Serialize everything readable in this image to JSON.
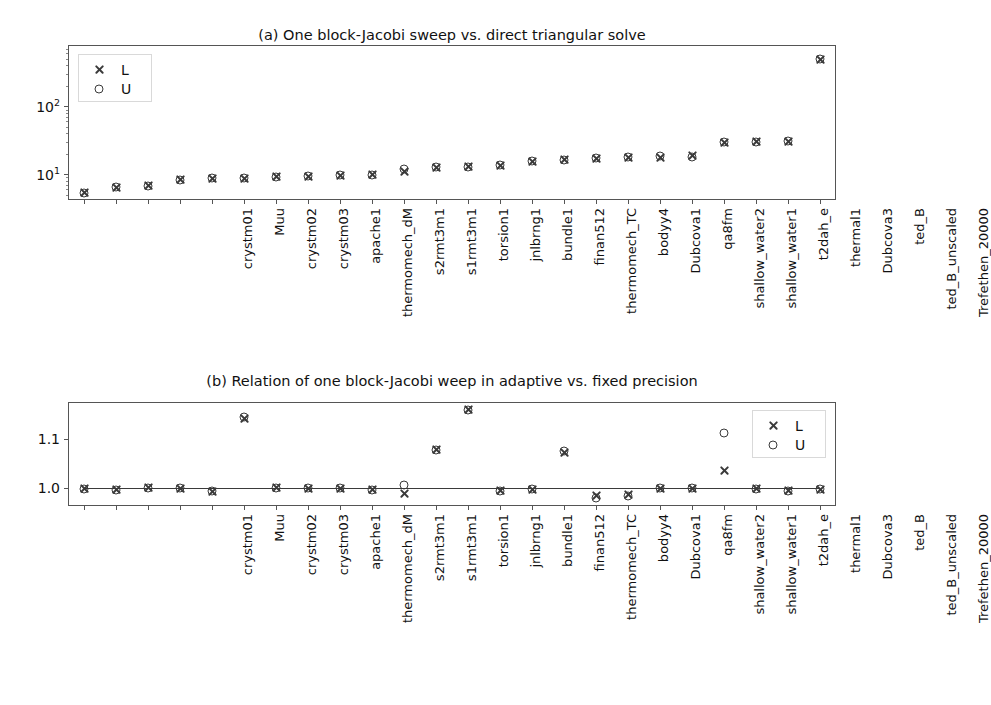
{
  "chart_data": [
    {
      "type": "scatter",
      "panel": "a",
      "title": "(a) One block-Jacobi sweep vs. direct triangular solve",
      "xlabel": "",
      "ylabel": "",
      "yscale": "log",
      "ylim": [
        4.2,
        800
      ],
      "ytick_labels": [
        "10¹",
        "10²"
      ],
      "ytick_values": [
        10,
        100
      ],
      "grid": false,
      "legend_position": "upper left",
      "legend": [
        "L",
        "U"
      ],
      "categories": [
        "crystm01",
        "Muu",
        "crystm02",
        "crystm03",
        "apache1",
        "thermomech_dM",
        "s2rmt3m1",
        "s1rmt3m1",
        "torsion1",
        "jnlbrng1",
        "bundle1",
        "finan512",
        "thermomech_TC",
        "bodyy4",
        "Dubcova1",
        "qa8fm",
        "shallow_water2",
        "shallow_water1",
        "t2dah_e",
        "thermal1",
        "Dubcova3",
        "ted_B",
        "ted_B_unscaled",
        "Trefethen_20000"
      ],
      "series": [
        {
          "name": "L",
          "marker": "x",
          "values": [
            5.4,
            6.5,
            6.8,
            8.4,
            8.7,
            8.8,
            9.3,
            9.4,
            9.7,
            9.8,
            11.2,
            12.7,
            13.0,
            13.6,
            15.5,
            16.5,
            17.3,
            17.6,
            18.0,
            18.8,
            29.5,
            30.0,
            30.5,
            490.0
          ]
        },
        {
          "name": "U",
          "marker": "o",
          "values": [
            5.4,
            6.5,
            6.8,
            8.4,
            8.7,
            8.8,
            9.3,
            9.4,
            9.7,
            9.8,
            12.2,
            12.7,
            13.0,
            13.6,
            15.5,
            16.5,
            17.5,
            17.8,
            18.4,
            17.9,
            29.5,
            30.0,
            30.5,
            490.0
          ]
        }
      ]
    },
    {
      "type": "scatter",
      "panel": "b",
      "title": "(b) Relation of one block-Jacobi weep in adaptive vs. fixed precision",
      "xlabel": "",
      "ylabel": "",
      "yscale": "linear",
      "ylim": [
        0.962,
        1.176
      ],
      "ytick_labels": [
        "1.0",
        "1.1"
      ],
      "ytick_values": [
        1.0,
        1.1
      ],
      "grid": false,
      "reference_line": 1.0,
      "legend_position": "upper right",
      "legend": [
        "L",
        "U"
      ],
      "categories": [
        "crystm01",
        "Muu",
        "crystm02",
        "crystm03",
        "apache1",
        "thermomech_dM",
        "s2rmt3m1",
        "s1rmt3m1",
        "torsion1",
        "jnlbrng1",
        "bundle1",
        "finan512",
        "thermomech_TC",
        "bodyy4",
        "Dubcova1",
        "qa8fm",
        "shallow_water2",
        "shallow_water1",
        "t2dah_e",
        "thermal1",
        "Dubcova3",
        "ted_B",
        "ted_B_unscaled",
        "Trefethen_20000"
      ],
      "series": [
        {
          "name": "L",
          "marker": "x",
          "values": [
            0.998,
            0.995,
            1.0,
            0.999,
            0.992,
            1.142,
            1.0,
            0.999,
            0.999,
            0.995,
            0.988,
            1.078,
            1.16,
            0.993,
            0.996,
            1.073,
            0.983,
            0.986,
            0.999,
            0.999,
            1.035,
            0.998,
            0.993,
            0.996
          ]
        },
        {
          "name": "U",
          "marker": "o",
          "values": [
            0.998,
            0.995,
            1.0,
            0.999,
            0.992,
            1.145,
            1.0,
            0.999,
            0.999,
            0.995,
            1.006,
            1.078,
            1.16,
            0.993,
            0.996,
            1.075,
            0.978,
            0.983,
            0.999,
            0.999,
            1.113,
            0.998,
            0.993,
            0.996
          ]
        }
      ]
    }
  ],
  "figure": {
    "background_color": "#ffffff",
    "marker_color": "#3a3a3a",
    "axis_color": "#555555"
  }
}
